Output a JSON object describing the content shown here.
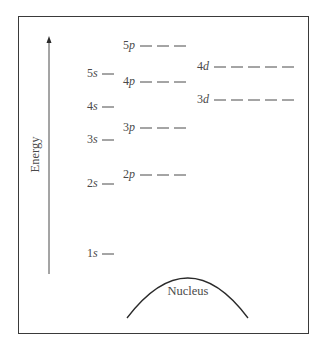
{
  "diagram": {
    "axis": {
      "label": "Energy",
      "direction": "up"
    },
    "nucleus": {
      "label": "Nucleus"
    },
    "colors": {
      "frame": "#3a3a3a",
      "line": "#4a4a4a",
      "text": "#4a4a4a"
    },
    "orbitals": [
      {
        "id": "1s",
        "n": "1",
        "l": "s",
        "boxes": 1,
        "x_label": 87,
        "x_line": 102,
        "y": 254
      },
      {
        "id": "2s",
        "n": "2",
        "l": "s",
        "boxes": 1,
        "x_label": 87,
        "x_line": 102,
        "y": 184
      },
      {
        "id": "3s",
        "n": "3",
        "l": "s",
        "boxes": 1,
        "x_label": 87,
        "x_line": 102,
        "y": 140
      },
      {
        "id": "4s",
        "n": "4",
        "l": "s",
        "boxes": 1,
        "x_label": 87,
        "x_line": 102,
        "y": 107
      },
      {
        "id": "5s",
        "n": "5",
        "l": "s",
        "boxes": 1,
        "x_label": 87,
        "x_line": 102,
        "y": 74
      },
      {
        "id": "2p",
        "n": "2",
        "l": "p",
        "boxes": 3,
        "x_label": 123,
        "x_line": 140,
        "y": 175
      },
      {
        "id": "3p",
        "n": "3",
        "l": "p",
        "boxes": 3,
        "x_label": 123,
        "x_line": 140,
        "y": 128
      },
      {
        "id": "4p",
        "n": "4",
        "l": "p",
        "boxes": 3,
        "x_label": 123,
        "x_line": 140,
        "y": 82
      },
      {
        "id": "5p",
        "n": "5",
        "l": "p",
        "boxes": 3,
        "x_label": 123,
        "x_line": 140,
        "y": 46
      },
      {
        "id": "3d",
        "n": "3",
        "l": "d",
        "boxes": 5,
        "x_label": 197,
        "x_line": 214,
        "y": 100
      },
      {
        "id": "4d",
        "n": "4",
        "l": "d",
        "boxes": 5,
        "x_label": 197,
        "x_line": 214,
        "y": 67
      }
    ]
  }
}
